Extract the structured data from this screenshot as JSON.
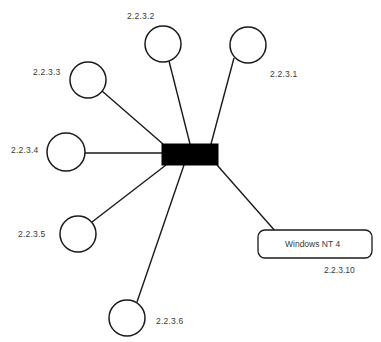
{
  "diagram": {
    "type": "network-topology",
    "background_color": "#ffffff",
    "stroke_color": "#1a1a1a",
    "text_color": "#3a3a3a",
    "hub": {
      "name": "central-bus",
      "shape": "filled-rectangle",
      "fill": "#000000",
      "x": 162,
      "y": 144,
      "width": 56,
      "height": 21
    },
    "nodes": [
      {
        "id": "node-1",
        "label": "2.2.3.1",
        "shape": "circle",
        "cx": 248,
        "cy": 45,
        "r": 18,
        "label_x": 270,
        "label_y": 70,
        "link_from_x": 234,
        "link_from_y": 58,
        "link_to_x": 211,
        "link_to_y": 144
      },
      {
        "id": "node-2",
        "label": "2.2.3.2",
        "shape": "circle",
        "cx": 163,
        "cy": 44,
        "r": 18,
        "label_x": 127,
        "label_y": 12,
        "link_from_x": 169,
        "link_from_y": 61,
        "link_to_x": 190,
        "link_to_y": 144
      },
      {
        "id": "node-3",
        "label": "2.2.3.3",
        "shape": "circle",
        "cx": 88,
        "cy": 80,
        "r": 18,
        "label_x": 33,
        "label_y": 68,
        "link_from_x": 102,
        "link_from_y": 91,
        "link_to_x": 163,
        "link_to_y": 144
      },
      {
        "id": "node-4",
        "label": "2.2.3.4",
        "shape": "circle",
        "cx": 66,
        "cy": 152,
        "r": 19,
        "label_x": 11,
        "label_y": 146,
        "link_from_x": 85,
        "link_from_y": 153,
        "link_to_x": 162,
        "link_to_y": 153
      },
      {
        "id": "node-5",
        "label": "2.2.3.5",
        "shape": "circle",
        "cx": 78,
        "cy": 234,
        "r": 18,
        "label_x": 18,
        "label_y": 230,
        "link_from_x": 92,
        "link_from_y": 222,
        "link_to_x": 166,
        "link_to_y": 165
      },
      {
        "id": "node-6",
        "label": "2.2.3.6",
        "shape": "circle",
        "cx": 127,
        "cy": 318,
        "r": 18,
        "label_x": 156,
        "label_y": 317,
        "link_from_x": 137,
        "link_from_y": 302,
        "link_to_x": 184,
        "link_to_y": 165
      }
    ],
    "host_box": {
      "id": "host-windows-nt-4",
      "label": "Windows NT 4",
      "address_label": "2.2.3.10",
      "shape": "rounded-rectangle",
      "x": 258,
      "y": 230,
      "width": 114,
      "height": 28,
      "corner_radius": 7,
      "label_x": 285,
      "label_y": 240,
      "address_x": 324,
      "address_y": 266,
      "link_from_x": 217,
      "link_from_y": 165,
      "link_to_x": 276,
      "link_to_y": 232
    }
  }
}
